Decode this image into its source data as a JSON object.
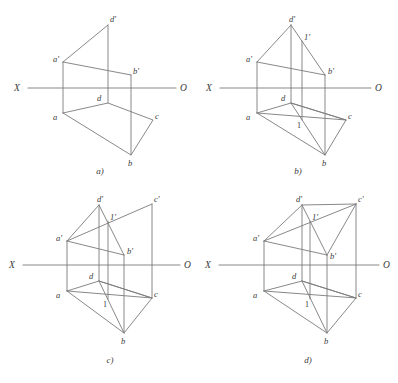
{
  "sheet": {
    "width": 398,
    "height": 383,
    "background": "#ffffff",
    "line_color": "#7b7b7b",
    "text_color": "#3a3a3a",
    "description": "Four-stage orthographic projection construction of a tetrahedron with horizontal and frontal projections separated by the X-O ground line."
  },
  "panels": [
    {
      "id": "a",
      "caption": "a)",
      "axis": {
        "left_label": "X",
        "right_label": "O"
      },
      "vertices": [
        {
          "name": "a-prime",
          "label": "a'"
        },
        {
          "name": "d-prime",
          "label": "d'"
        },
        {
          "name": "b-prime",
          "label": "b'"
        },
        {
          "name": "a",
          "label": "a"
        },
        {
          "name": "d",
          "label": "d"
        },
        {
          "name": "b",
          "label": "b"
        },
        {
          "name": "c",
          "label": "c"
        }
      ]
    },
    {
      "id": "b",
      "caption": "b)",
      "axis": {
        "left_label": "X",
        "right_label": "O"
      },
      "vertices": [
        {
          "name": "a-prime",
          "label": "a'"
        },
        {
          "name": "d-prime",
          "label": "d'"
        },
        {
          "name": "b-prime",
          "label": "b'"
        },
        {
          "name": "one-prime",
          "label": "1'"
        },
        {
          "name": "a",
          "label": "a"
        },
        {
          "name": "d",
          "label": "d"
        },
        {
          "name": "b",
          "label": "b"
        },
        {
          "name": "c",
          "label": "c"
        },
        {
          "name": "one",
          "label": "1"
        }
      ]
    },
    {
      "id": "c",
      "caption": "c)",
      "axis": {
        "left_label": "X",
        "right_label": "O"
      },
      "vertices": [
        {
          "name": "a-prime",
          "label": "a'"
        },
        {
          "name": "d-prime",
          "label": "d'"
        },
        {
          "name": "b-prime",
          "label": "b'"
        },
        {
          "name": "c-prime",
          "label": "c'"
        },
        {
          "name": "one-prime",
          "label": "1'"
        },
        {
          "name": "a",
          "label": "a"
        },
        {
          "name": "d",
          "label": "d"
        },
        {
          "name": "b",
          "label": "b"
        },
        {
          "name": "c",
          "label": "c"
        },
        {
          "name": "one",
          "label": "1"
        }
      ]
    },
    {
      "id": "d",
      "caption": "d)",
      "axis": {
        "left_label": "X",
        "right_label": "O"
      },
      "vertices": [
        {
          "name": "a-prime",
          "label": "a'"
        },
        {
          "name": "d-prime",
          "label": "d'"
        },
        {
          "name": "b-prime",
          "label": "b'"
        },
        {
          "name": "c-prime",
          "label": "c'"
        },
        {
          "name": "one-prime",
          "label": "1'"
        },
        {
          "name": "a",
          "label": "a"
        },
        {
          "name": "d",
          "label": "d"
        },
        {
          "name": "b",
          "label": "b"
        },
        {
          "name": "c",
          "label": "c"
        },
        {
          "name": "one",
          "label": "1"
        }
      ]
    }
  ]
}
